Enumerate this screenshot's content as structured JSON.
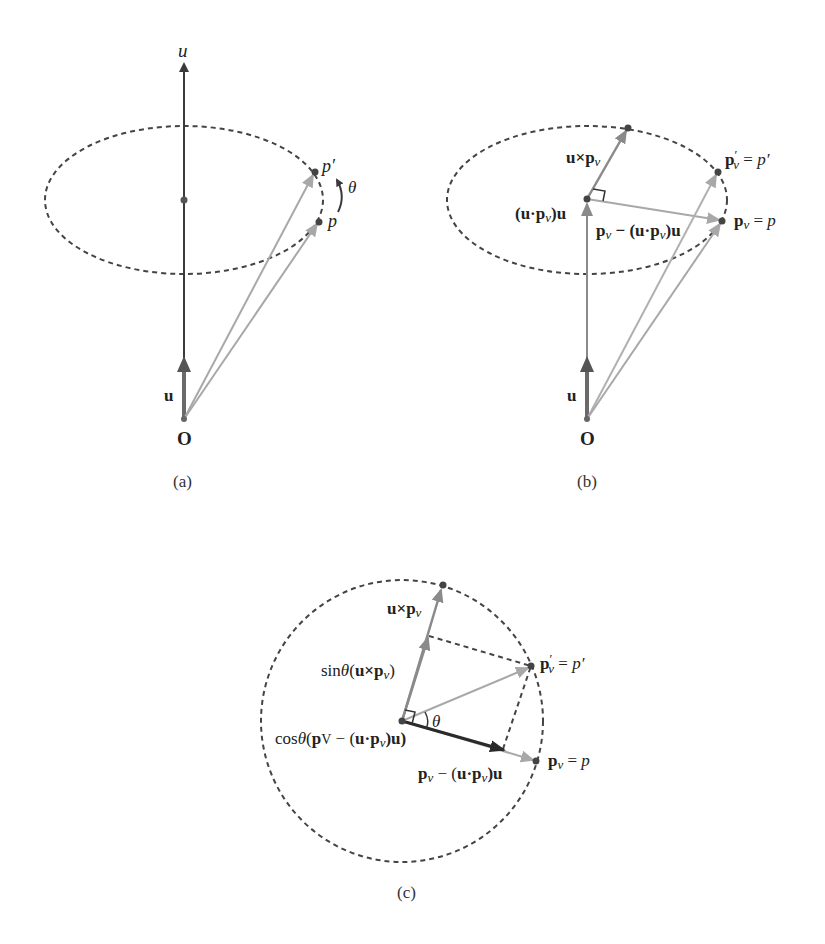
{
  "figure": {
    "panels": [
      {
        "id": "a",
        "caption": "(a)",
        "labels": {
          "axis": "u",
          "unit_vector": "u",
          "origin": "O",
          "p_prime": "p′",
          "p": "p",
          "angle": "θ"
        }
      },
      {
        "id": "b",
        "caption": "(b)",
        "labels": {
          "cross": "u×p",
          "cross_sub": "v",
          "projection_pre": "(u·p",
          "projection_sub": "v",
          "projection_post": ")u",
          "perp_pre": "p",
          "perp_sub": "v",
          "perp_mid": " − (u·p",
          "perp_sub2": "v",
          "perp_post": ")u",
          "p_prime_main": "p",
          "p_prime_sup": "′",
          "p_prime_sub": "v",
          "p_prime_eq": " = ",
          "p_prime_rhs": "p′",
          "p_main": "p",
          "p_sub": "v",
          "p_eq": " = ",
          "p_rhs": "p",
          "unit_vector": "u",
          "origin": "O"
        }
      },
      {
        "id": "c",
        "caption": "(c)",
        "labels": {
          "cross": "u×p",
          "cross_sub": "v",
          "sin_fn": "sin",
          "sin_theta": "θ",
          "sin_open": "(",
          "sin_arg": "u×p",
          "sin_sub": "v",
          "sin_close": ")",
          "cos_fn": "cos",
          "cos_theta": "θ",
          "cos_open": "(",
          "cos_arg_pre": "p",
          "cos_arg_sub": "V",
          "cos_arg_mid": " − (",
          "cos_arg_u": "u·p",
          "cos_arg_sub2": "v",
          "cos_arg_post": ")u)",
          "angle": "θ",
          "perp_pre": "p",
          "perp_sub": "v",
          "perp_mid": " − (",
          "perp_u": "u·p",
          "perp_sub2": "v",
          "perp_post": ")u",
          "p_prime_main": "p",
          "p_prime_sup": "′",
          "p_prime_sub": "v",
          "p_prime_eq": " = ",
          "p_prime_rhs": "p′",
          "p_main": "p",
          "p_sub": "v",
          "p_eq": " = ",
          "p_rhs": "p"
        }
      }
    ],
    "colors": {
      "axis_dark": "#3a3a3a",
      "vector_gray": "#8a8a8a",
      "vector_light": "#a8a8a8",
      "vector_dark": "#2a2a2a",
      "dash": "#444444",
      "dot": "#444444"
    }
  }
}
